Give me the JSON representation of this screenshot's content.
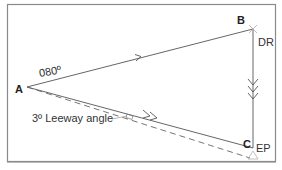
{
  "diagram": {
    "type": "navigation-vector-triangle",
    "points": {
      "A": {
        "label": "A"
      },
      "B": {
        "label": "B"
      },
      "C": {
        "label": "C"
      }
    },
    "labels": {
      "heading": "080º",
      "dr": "DR",
      "ep": "EP",
      "leeway": "3º Leeway angle"
    },
    "colors": {
      "line": "#555555",
      "frame": "#8a8a8a",
      "text": "#222222",
      "ep_marker": "#b0b0b0"
    }
  }
}
